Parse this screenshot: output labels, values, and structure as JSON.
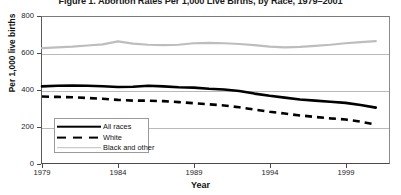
{
  "chart_data": {
    "type": "line",
    "title": "Figure 1. Abortion Rates Per 1,000 Live Births, by Race, 1979–2001",
    "xlabel": "Year",
    "ylabel": "Per 1,000 live births",
    "ylim": [
      0,
      800
    ],
    "xlim": [
      1979,
      2002
    ],
    "yticks": [
      0,
      200,
      400,
      600,
      800
    ],
    "ytick_labels": [
      "0",
      "200",
      "400",
      "600",
      "800"
    ],
    "xticks": [
      1979,
      1984,
      1989,
      1994,
      1999
    ],
    "xtick_labels": [
      "1979",
      "1984",
      "1989",
      "1994",
      "1999"
    ],
    "grid": true,
    "grid_axis": "y",
    "legend_position": "lower-left-inside",
    "x": [
      1979,
      1980,
      1981,
      1982,
      1983,
      1984,
      1985,
      1986,
      1987,
      1988,
      1989,
      1990,
      1991,
      1992,
      1993,
      1994,
      1995,
      1996,
      1997,
      1998,
      1999,
      2000,
      2001
    ],
    "series": [
      {
        "name": "All races",
        "style": "solid",
        "color": "#000000",
        "width": 2.6,
        "values": [
          425,
          428,
          430,
          428,
          426,
          422,
          423,
          428,
          425,
          420,
          418,
          412,
          408,
          400,
          386,
          374,
          364,
          354,
          348,
          342,
          336,
          324,
          310
        ]
      },
      {
        "name": "White",
        "style": "dashed",
        "color": "#000000",
        "width": 2.6,
        "values": [
          370,
          368,
          366,
          362,
          358,
          352,
          348,
          348,
          345,
          340,
          334,
          328,
          322,
          312,
          300,
          288,
          278,
          268,
          260,
          252,
          246,
          234,
          218
        ]
      },
      {
        "name": "Black and other",
        "style": "solid",
        "color": "#bdbdbd",
        "width": 2.2,
        "values": [
          632,
          636,
          640,
          646,
          652,
          668,
          656,
          650,
          648,
          650,
          658,
          660,
          658,
          654,
          648,
          640,
          636,
          638,
          644,
          650,
          658,
          664,
          670
        ]
      }
    ],
    "legend": [
      {
        "label": "All races",
        "swatch": "solid-black"
      },
      {
        "label": "White",
        "swatch": "dashed-black"
      },
      {
        "label": "Black and other",
        "swatch": "solid-gray"
      }
    ],
    "colors": {
      "all_races": "#000000",
      "white": "#000000",
      "black_and_other": "#bdbdbd",
      "axis": "#4a4a4a",
      "grid": "#b9b9b9",
      "background": "#ffffff"
    }
  }
}
